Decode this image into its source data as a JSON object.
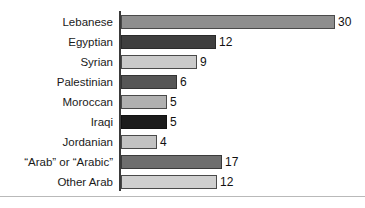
{
  "chart_data": {
    "type": "bar",
    "orientation": "horizontal",
    "title": "",
    "subtitle": "",
    "xlabel": "",
    "ylabel": "",
    "grid": false,
    "legend": "none",
    "axis": {
      "category_axis": "vertical-left",
      "value_axis_visible": false,
      "tick_labels": [],
      "xlim": [
        0,
        30
      ]
    },
    "categories": [
      "Lebanese",
      "Egyptian",
      "Syrian",
      "Palestinian",
      "Moroccan",
      "Iraqi",
      "Jordanian",
      "“Arab” or “Arabic”",
      "Other Arab"
    ],
    "values": [
      30,
      12,
      9,
      6,
      5,
      5,
      4,
      17,
      12
    ],
    "value_labels": [
      "30",
      "12",
      "9",
      "6",
      "5",
      "5",
      "4",
      "17",
      "12"
    ],
    "bars": [
      {
        "category": "Lebanese",
        "value": 30,
        "label": "30",
        "bar_px": 214,
        "fill": "#8e8e8e",
        "stroke": "#4a4a4a"
      },
      {
        "category": "Egyptian",
        "value": 12,
        "label": "12",
        "bar_px": 95,
        "fill": "#3f3f3f",
        "stroke": "#2a2a2a"
      },
      {
        "category": "Syrian",
        "value": 9,
        "label": "9",
        "bar_px": 76,
        "fill": "#cacaca",
        "stroke": "#4a4a4a"
      },
      {
        "category": "Palestinian",
        "value": 6,
        "label": "6",
        "bar_px": 56,
        "fill": "#565656",
        "stroke": "#333333"
      },
      {
        "category": "Moroccan",
        "value": 5,
        "label": "5",
        "bar_px": 46,
        "fill": "#b0b0b0",
        "stroke": "#4a4a4a"
      },
      {
        "category": "Iraqi",
        "value": 5,
        "label": "5",
        "bar_px": 46,
        "fill": "#1c1c1c",
        "stroke": "#111111"
      },
      {
        "category": "Jordanian",
        "value": 4,
        "label": "4",
        "bar_px": 36,
        "fill": "#c2c2c2",
        "stroke": "#4a4a4a"
      },
      {
        "category": "“Arab” or “Arabic”",
        "value": 17,
        "label": "17",
        "bar_px": 101,
        "fill": "#6e6e6e",
        "stroke": "#3a3a3a"
      },
      {
        "category": "Other Arab",
        "value": 12,
        "label": "12",
        "bar_px": 96,
        "fill": "#cfcfcf",
        "stroke": "#4a4a4a"
      }
    ]
  },
  "colors": {
    "background": "#ffffff",
    "axis_line": "#3a3a3a",
    "bottom_rule": "#b9b9b9",
    "label_text": "#1a1a1a",
    "value_text": "#111111"
  }
}
